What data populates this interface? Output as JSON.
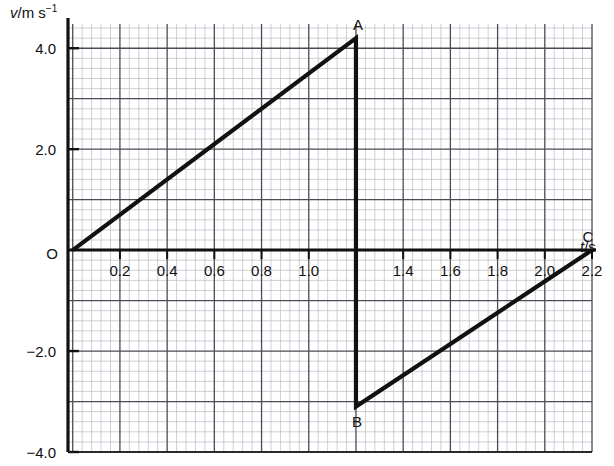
{
  "figure": {
    "kind": "velocity-time-graph",
    "background_color": "#ffffff",
    "ink_color": "#111111",
    "grid_minor_color": "#b9bcc4",
    "grid_major_color": "#4a4d55"
  },
  "axes": {
    "y_label_prefix": "v",
    "y_label_suffix": "/m s",
    "y_label_exponent": "−1",
    "x_label_prefix": "t",
    "x_label_suffix": "/s",
    "origin_label": "O",
    "x_ticks": [
      "0.2",
      "0.4",
      "0.6",
      "0.8",
      "1.0",
      "1.4",
      "1.6",
      "1.8",
      "2.0",
      "2.2"
    ],
    "x_tick_values": [
      0.2,
      0.4,
      0.6,
      0.8,
      1.0,
      1.4,
      1.6,
      1.8,
      2.0,
      2.2
    ],
    "y_ticks": [
      "4.0",
      "2.0",
      "−2.0",
      "−4.0"
    ],
    "y_tick_values": [
      4.0,
      2.0,
      -2.0,
      -4.0
    ],
    "xlim": [
      -0.02,
      2.2
    ],
    "ylim": [
      -4.5,
      4.5
    ],
    "x_major_step": 0.2,
    "x_minor_step": 0.04,
    "y_major_step": 1.0,
    "y_minor_step": 0.2,
    "grid": true
  },
  "point_labels": [
    {
      "name": "A",
      "text": "A",
      "t": 1.2,
      "v": 4.2
    },
    {
      "name": "B",
      "text": "B",
      "t": 1.2,
      "v": -3.1
    },
    {
      "name": "C",
      "text": "C",
      "t": 2.2,
      "v": 0.0
    }
  ],
  "chart_data": {
    "type": "line",
    "title": "",
    "xlabel": "t/s",
    "ylabel": "v/m s^-1",
    "xlim": [
      0,
      2.2
    ],
    "ylim": [
      -4.0,
      4.4
    ],
    "grid": true,
    "legend": null,
    "series": [
      {
        "name": "velocity",
        "x": [
          0.0,
          1.2,
          1.2,
          2.2
        ],
        "y": [
          0.0,
          4.2,
          -3.1,
          0.0
        ],
        "annotations": [
          "O",
          "A",
          "B",
          "C"
        ]
      }
    ],
    "segments": [
      {
        "from": "O",
        "to": "A",
        "t_from": 0.0,
        "t_to": 1.2,
        "v_from": 0.0,
        "v_to": 4.2,
        "description": "uniform acceleration"
      },
      {
        "from": "A",
        "to": "B",
        "t_from": 1.2,
        "t_to": 1.2,
        "v_from": 4.2,
        "v_to": -3.1,
        "description": "instantaneous reversal"
      },
      {
        "from": "B",
        "to": "C",
        "t_from": 1.2,
        "t_to": 2.2,
        "v_from": -3.1,
        "v_to": 0.0,
        "description": "uniform acceleration back to zero"
      }
    ]
  }
}
